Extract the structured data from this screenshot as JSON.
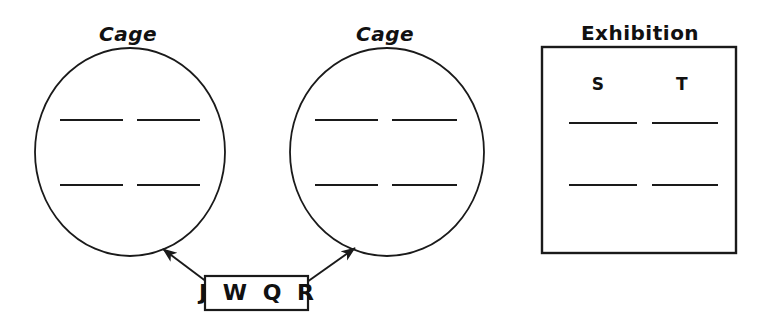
{
  "canvas": {
    "width": 770,
    "height": 328,
    "background": "#ffffff",
    "stroke_color": "#1a1a1a"
  },
  "diagram": {
    "kind": "enclosure-assignment-worksheet",
    "groups": [
      {
        "id": "cage-left",
        "title": "Cage",
        "shape": "circle",
        "title_x": 128,
        "title_y": 22,
        "cx": 130,
        "cy": 152,
        "rx": 95,
        "ry": 104,
        "blanks": [
          {
            "name": "blank-left-top-1",
            "x1": 60,
            "y1": 120,
            "x2": 123,
            "y2": 120,
            "value": ""
          },
          {
            "name": "blank-left-top-2",
            "x1": 137,
            "y1": 120,
            "x2": 200,
            "y2": 120,
            "value": ""
          },
          {
            "name": "blank-left-bottom-1",
            "x1": 60,
            "y1": 185,
            "x2": 123,
            "y2": 185,
            "value": ""
          },
          {
            "name": "blank-left-bottom-2",
            "x1": 137,
            "y1": 185,
            "x2": 200,
            "y2": 185,
            "value": ""
          }
        ],
        "slot_letters": []
      },
      {
        "id": "cage-right",
        "title": "Cage",
        "shape": "circle",
        "title_x": 385,
        "title_y": 22,
        "cx": 387,
        "cy": 152,
        "rx": 97,
        "ry": 104,
        "blanks": [
          {
            "name": "blank-mid-top-1",
            "x1": 315,
            "y1": 120,
            "x2": 378,
            "y2": 120,
            "value": ""
          },
          {
            "name": "blank-mid-top-2",
            "x1": 392,
            "y1": 120,
            "x2": 457,
            "y2": 120,
            "value": ""
          },
          {
            "name": "blank-mid-bottom-1",
            "x1": 315,
            "y1": 185,
            "x2": 378,
            "y2": 185,
            "value": ""
          },
          {
            "name": "blank-mid-bottom-2",
            "x1": 392,
            "y1": 185,
            "x2": 457,
            "y2": 185,
            "value": ""
          }
        ],
        "slot_letters": []
      },
      {
        "id": "exhibition",
        "title": "Exhibition",
        "shape": "rectangle",
        "title_x": 640,
        "title_y": 21,
        "x": 542,
        "y": 47,
        "width": 194,
        "height": 206,
        "blanks": [
          {
            "name": "blank-exhibition-top-1",
            "x1": 569,
            "y1": 123,
            "x2": 637,
            "y2": 123,
            "value": ""
          },
          {
            "name": "blank-exhibition-top-2",
            "x1": 652,
            "y1": 123,
            "x2": 718,
            "y2": 123,
            "value": ""
          },
          {
            "name": "blank-exhibition-bottom-1",
            "x1": 569,
            "y1": 185,
            "x2": 637,
            "y2": 185,
            "value": ""
          },
          {
            "name": "blank-exhibition-bottom-2",
            "x1": 652,
            "y1": 185,
            "x2": 718,
            "y2": 185,
            "value": ""
          }
        ],
        "slot_letters": [
          {
            "name": "slot-letter-s",
            "text": "S",
            "x": 598,
            "y": 96
          },
          {
            "name": "slot-letter-t",
            "text": "T",
            "x": 682,
            "y": 96
          }
        ]
      }
    ],
    "pool_tag": {
      "id": "item-pool",
      "text": "J W Q R",
      "items": [
        "J",
        "W",
        "Q",
        "R"
      ],
      "box": {
        "x": 205,
        "y": 276,
        "width": 103,
        "height": 34
      }
    },
    "connectors": [
      {
        "name": "arrow-pool-to-cage-left",
        "from_x": 207,
        "from_y": 282,
        "to_x": 163,
        "to_y": 249,
        "arrowhead": "end"
      },
      {
        "name": "arrow-pool-to-cage-right",
        "from_x": 307,
        "from_y": 282,
        "to_x": 355,
        "to_y": 248,
        "arrowhead": "end"
      }
    ]
  }
}
